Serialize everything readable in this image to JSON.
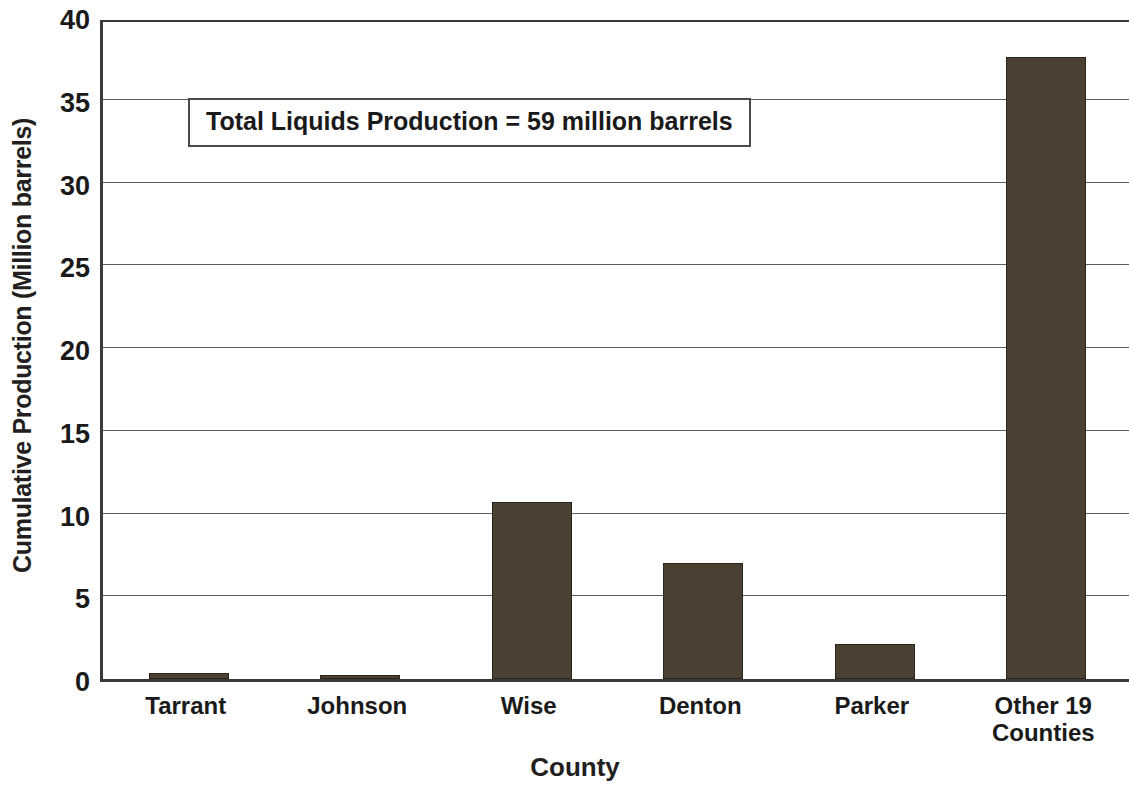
{
  "chart_data": {
    "type": "bar",
    "title": "",
    "xlabel": "County",
    "ylabel": "Cumulative Production (Million barrels)",
    "categories": [
      "Tarrant",
      "Johnson",
      "Wise",
      "Denton",
      "Parker",
      "Other 19 Counties"
    ],
    "category_labels_wrapped": [
      "Tarrant",
      "Johnson",
      "Wise",
      "Denton",
      "Parker",
      "Other 19\nCounties"
    ],
    "values": [
      0.35,
      0.25,
      10.7,
      7.0,
      2.1,
      37.6
    ],
    "ylim": [
      0,
      40
    ],
    "ytick_values": [
      0,
      5,
      10,
      15,
      20,
      25,
      30,
      35,
      40
    ],
    "ytick_labels": [
      "0",
      "5",
      "10",
      "15",
      "20",
      "25",
      "30",
      "35",
      "40"
    ],
    "grid": "horizontal",
    "legend": "none",
    "bar_color": "#4a4133",
    "bar_edge_color": "#2b241c",
    "axis_color": "#3a3a3a",
    "gridline_color": "#5c5c5c",
    "annotations": [
      {
        "text": "Total Liquids Production = 59 million barrels",
        "value": 59,
        "units": "million barrels"
      }
    ]
  }
}
